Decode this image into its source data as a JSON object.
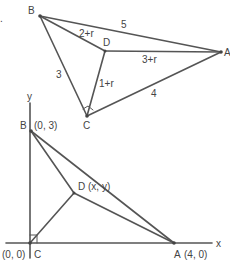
{
  "top_figure": {
    "points": {
      "B": {
        "label": "B"
      },
      "D": {
        "label": "D"
      },
      "A": {
        "label": "A"
      },
      "C": {
        "label": "C"
      }
    },
    "edge_labels": {
      "BA": "5",
      "BD": "2+r",
      "DA": "3+r",
      "BC": "3",
      "DC": "1+r",
      "CA": "4"
    },
    "stray_mark": "."
  },
  "bottom_figure": {
    "axis_labels": {
      "y": "y",
      "x": "x"
    },
    "points": {
      "B": {
        "label": "B",
        "coord": "(0, 3)"
      },
      "D": {
        "label": "D",
        "coord": "(x, y)"
      },
      "A": {
        "label": "A",
        "coord": "(4, 0)"
      },
      "C": {
        "label": "C",
        "coord": "(0, 0)"
      }
    }
  },
  "colors": {
    "line": "#555555",
    "text": "#444444",
    "background": "#ffffff"
  }
}
